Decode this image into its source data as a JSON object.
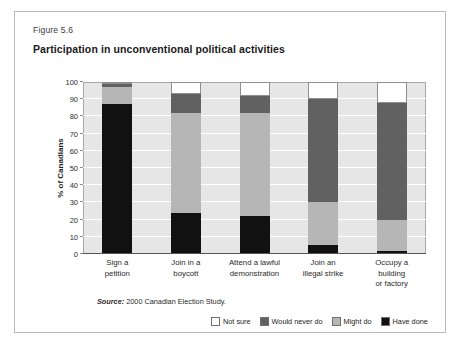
{
  "figure": {
    "number": "Figure 5.6",
    "title": "Participation in unconventional political activities",
    "source_label": "Source:",
    "source_text": "2000 Canadian Election Study."
  },
  "legend": {
    "position": "bottom-right",
    "items": [
      {
        "label": "Not sure",
        "color": "#ffffff",
        "icon": "legend-swatch-not-sure"
      },
      {
        "label": "Would never do",
        "color": "#616161",
        "icon": "legend-swatch-would-never-do"
      },
      {
        "label": "Might do",
        "color": "#b6b6b6",
        "icon": "legend-swatch-might-do"
      },
      {
        "label": "Have done",
        "color": "#111111",
        "icon": "legend-swatch-have-done"
      }
    ]
  },
  "chart_data": {
    "type": "bar",
    "stacked": true,
    "title": "Participation in unconventional political activities",
    "xlabel": "",
    "ylabel": "% of Canadians",
    "ylim": [
      0,
      100
    ],
    "yticks": [
      0,
      10,
      20,
      30,
      40,
      50,
      60,
      70,
      80,
      90,
      100
    ],
    "ytick_labels": [
      "0",
      "10",
      "20",
      "30",
      "40",
      "50",
      "60",
      "70",
      "80",
      "90",
      "100"
    ],
    "grid": true,
    "grid_axis": "y",
    "categories": [
      "Sign a petition",
      "Join in a boycott",
      "Attend a lawful demonstration",
      "Join an illegal strike",
      "Occupy a building or factory"
    ],
    "category_lines": [
      [
        "Sign a",
        "petition"
      ],
      [
        "Join in a",
        "boycott"
      ],
      [
        "Attend a lawful",
        "demonstration"
      ],
      [
        "Join an",
        "illegal strike"
      ],
      [
        "Occupy a",
        "building",
        "or factory"
      ]
    ],
    "series": [
      {
        "name": "Have done",
        "color": "#111111",
        "values": [
          87,
          24,
          22,
          5,
          2
        ]
      },
      {
        "name": "Might do",
        "color": "#b6b6b6",
        "values": [
          10,
          58,
          60,
          25,
          18
        ]
      },
      {
        "name": "Would never do",
        "color": "#616161",
        "values": [
          2,
          11,
          10,
          60,
          68
        ]
      },
      {
        "name": "Not sure",
        "color": "#ffffff",
        "values": [
          1,
          7,
          8,
          10,
          12
        ]
      }
    ]
  },
  "colors": {
    "plot_background": "#e6e6e6",
    "gridline": "#ffffff",
    "frame_border": "#b9b9b9",
    "axis": "#555555"
  }
}
